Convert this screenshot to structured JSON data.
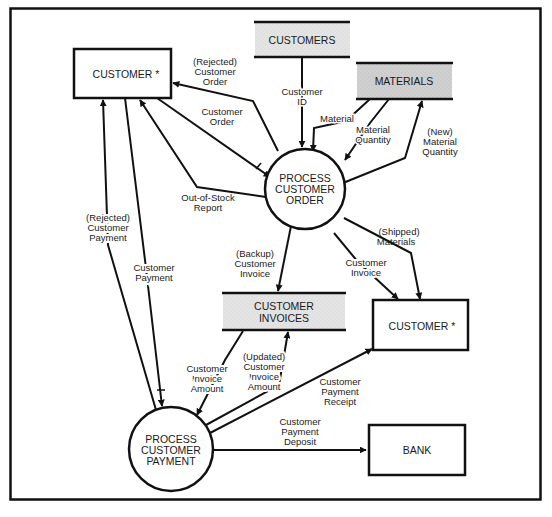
{
  "diagram": {
    "type": "data-flow-diagram",
    "colors": {
      "line": "#111111",
      "store_fill": "#e3e3e3",
      "store_fill_dark": "#d2d2d2",
      "background": "#ffffff"
    },
    "entities": {
      "customer_top": {
        "label": "CUSTOMER *"
      },
      "customer_right": {
        "label": "CUSTOMER *"
      },
      "bank": {
        "label": "BANK"
      }
    },
    "stores": {
      "customers": {
        "label": "CUSTOMERS"
      },
      "materials": {
        "label": "MATERIALS"
      },
      "customer_invoices": {
        "line1": "CUSTOMER",
        "line2": "INVOICES"
      }
    },
    "processes": {
      "process_order": {
        "line1": "PROCESS",
        "line2": "CUSTOMER",
        "line3": "ORDER"
      },
      "process_payment": {
        "line1": "PROCESS",
        "line2": "CUSTOMER",
        "line3": "PAYMENT"
      }
    },
    "flows": {
      "rejected_order": [
        "(Rejected)",
        "Customer",
        "Order"
      ],
      "customer_order": [
        "Customer",
        "Order"
      ],
      "customer_id": [
        "Customer",
        "ID"
      ],
      "material": [
        "Material"
      ],
      "material_quantity": [
        "Material",
        "Quantity"
      ],
      "new_material_quantity": [
        "(New)",
        "Material",
        "Quantity"
      ],
      "out_of_stock": [
        "Out-of-Stock",
        "Report"
      ],
      "rejected_payment": [
        "(Rejected)",
        "Customer",
        "Payment"
      ],
      "customer_payment": [
        "Customer",
        "Payment"
      ],
      "backup_invoice": [
        "(Backup)",
        "Customer",
        "Invoice"
      ],
      "customer_invoice": [
        "Customer",
        "Invoice"
      ],
      "shipped_materials": [
        "(Shipped)",
        "Materials"
      ],
      "invoice_amount": [
        "Customer",
        "Invoice",
        "Amount"
      ],
      "updated_invoice_amount": [
        "(Updated)",
        "Customer",
        "Invoice",
        "Amount"
      ],
      "payment_receipt": [
        "Customer",
        "Payment",
        "Receipt"
      ],
      "payment_deposit": [
        "Customer",
        "Payment",
        "Deposit"
      ]
    }
  }
}
